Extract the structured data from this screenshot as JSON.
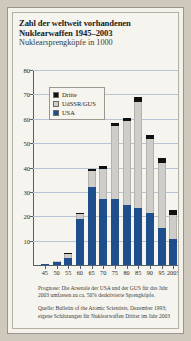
{
  "header": {
    "title_line1": "Zahl der weltweit vorhandenen",
    "title_line2": "Nuklearwaffen 1945–2003",
    "subtitle": "Nuklearsprengköpfe in 1000"
  },
  "legend": {
    "items": [
      {
        "label": "Dritte",
        "color": "#111111"
      },
      {
        "label": "UdSSR/GUS",
        "color": "#cfcdc9"
      },
      {
        "label": "USA",
        "color": "#1f4e8c"
      }
    ]
  },
  "notes": {
    "prognose": "Prognose: Die Arsenale der USA und der GUS für das Jahr 2003 umfassen zu ca. 50% deaktivierte Sprengköpfe.",
    "quelle": "Quelle: Bulletin of the Atomic Scientists, Dezember 1993; eigene Schätzungen für Nuklearwaffen Dritter im Jahr 2003"
  },
  "chart_data": {
    "type": "bar",
    "stacked": true,
    "title": "Zahl der weltweit vorhandenen Nuklearwaffen 1945–2003",
    "subtitle": "Nuklearsprengköpfe in 1000",
    "xlabel": "",
    "ylabel": "",
    "ylim": [
      0,
      80
    ],
    "yticks": [
      10,
      20,
      30,
      40,
      50,
      60,
      70,
      80
    ],
    "grid": true,
    "legend_position": "upper-left-inside",
    "categories": [
      "45",
      "50",
      "55",
      "60",
      "65",
      "70",
      "75",
      "80",
      "85",
      "90",
      "95",
      "2003"
    ],
    "series": [
      {
        "name": "USA",
        "color": "#1f4e8c",
        "values": [
          0.3,
          1.2,
          3.0,
          19.0,
          32.0,
          27.0,
          27.0,
          24.5,
          23.5,
          21.5,
          15.0,
          10.5
        ]
      },
      {
        "name": "UdSSR/GUS",
        "color": "#cfcdc9",
        "values": [
          0.0,
          0.1,
          1.5,
          2.0,
          6.5,
          12.5,
          30.0,
          34.5,
          43.5,
          30.0,
          27.0,
          10.0
        ]
      },
      {
        "name": "Dritte",
        "color": "#111111",
        "values": [
          0.0,
          0.0,
          0.2,
          0.4,
          0.8,
          1.0,
          1.2,
          1.5,
          1.8,
          1.8,
          1.8,
          2.0
        ]
      }
    ],
    "totals": [
      0.3,
      1.3,
      4.7,
      21.4,
      39.3,
      40.5,
      58.2,
      60.5,
      68.8,
      53.3,
      43.8,
      22.5
    ]
  }
}
